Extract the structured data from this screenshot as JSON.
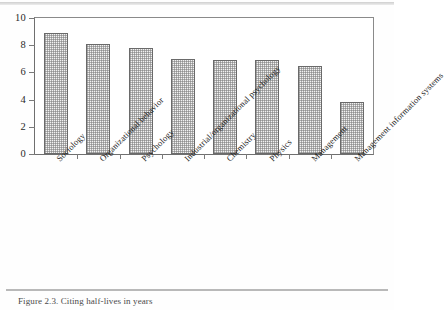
{
  "figure": {
    "caption": "Figure 2.3. Citing half-lives in years"
  },
  "chart_data": {
    "type": "bar",
    "title": "",
    "xlabel": "",
    "ylabel": "",
    "ylim": [
      0,
      10
    ],
    "yticks": [
      0,
      2,
      4,
      6,
      8,
      10
    ],
    "grid": false,
    "legend": "none",
    "categories": [
      "Sociology",
      "Organizational behavior",
      "Psychology",
      "Industrial/organizational psychology",
      "Chemistry",
      "Physics",
      "Management",
      "Management information systems"
    ],
    "values": [
      8.9,
      8.1,
      7.8,
      7.0,
      6.9,
      6.9,
      6.5,
      3.8
    ],
    "bar_fill_color": "#f2f2f2",
    "bar_edge_color": "#6a6a6a",
    "axis_color": "#6f6f6f"
  }
}
